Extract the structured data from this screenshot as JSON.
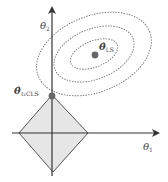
{
  "diagram": {
    "axes": {
      "x_label": "θ",
      "x_sub": "1",
      "y_label": "θ",
      "y_sub": "2"
    },
    "points": {
      "ls": {
        "label": "θ̂",
        "sub": "LS"
      },
      "cls": {
        "label": "θ̂",
        "sub": "ℓ₁CLS"
      }
    },
    "colors": {
      "axis": "#333333",
      "diamond_fill": "#e6e6e6",
      "diamond_stroke": "#555555",
      "contour": "#777777",
      "point": "#666666"
    }
  }
}
